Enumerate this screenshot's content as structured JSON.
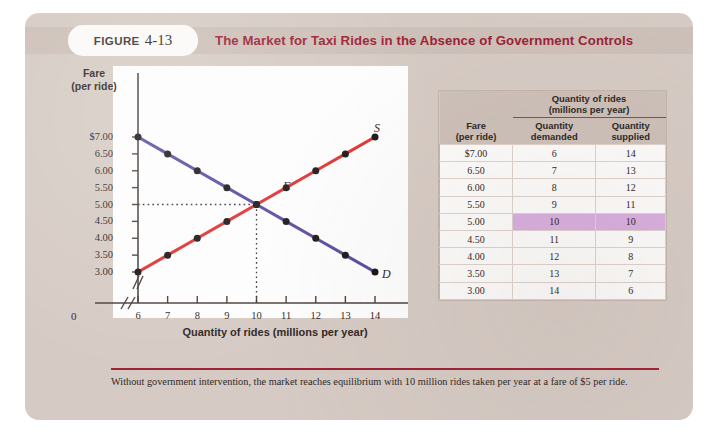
{
  "figure": {
    "label_word": "FIGURE",
    "number": "4-13",
    "title": "The Market for Taxi Rides in the Absence of Government Controls",
    "caption": "Without government intervention, the market reaches equilibrium with 10 million rides taken per year at a fare of $5 per ride.",
    "colors": {
      "panel": "#d6cbc4",
      "header_band": "#cdc0b8",
      "title_red": "#9d2235",
      "supply_red": "#e03030",
      "demand_purple": "#5b4a9e",
      "highlight_purple": "#d9aede",
      "point_black": "#1a1416"
    }
  },
  "chart_data": {
    "type": "line",
    "title": "The Market for Taxi Rides in the Absence of Government Controls",
    "xlabel": "Quantity of rides (millions per year)",
    "ylabel": "Fare (per ride)",
    "ylabel_line1": "Fare",
    "ylabel_line2": "(per ride)",
    "xlim": [
      6,
      14
    ],
    "ylim": [
      3.0,
      7.0
    ],
    "x_ticks": [
      "6",
      "7",
      "8",
      "9",
      "10",
      "11",
      "12",
      "13",
      "14"
    ],
    "x_origin_tick": "0",
    "y_ticks": [
      "$7.00",
      "6.50",
      "6.00",
      "5.50",
      "5.00",
      "4.50",
      "4.00",
      "3.50",
      "3.00"
    ],
    "axis_break_x": true,
    "axis_break_y": true,
    "grid": false,
    "legend": "inline-curve-labels",
    "series": [
      {
        "name": "Supply",
        "label": "S",
        "color": "#e03030",
        "x": [
          6,
          7,
          8,
          9,
          10,
          11,
          12,
          13,
          14
        ],
        "y": [
          3.0,
          3.5,
          4.0,
          4.5,
          5.0,
          5.5,
          6.0,
          6.5,
          7.0
        ]
      },
      {
        "name": "Demand",
        "label": "D",
        "color": "#5b4a9e",
        "x": [
          6,
          7,
          8,
          9,
          10,
          11,
          12,
          13,
          14
        ],
        "y": [
          7.0,
          6.5,
          6.0,
          5.5,
          5.0,
          4.5,
          4.0,
          3.5,
          3.0
        ]
      }
    ],
    "annotations": [
      {
        "label": "E",
        "x": 10,
        "y": 5.0,
        "note": "equilibrium point"
      }
    ],
    "guide_lines": [
      {
        "orientation": "horizontal",
        "value": 5.0,
        "style": "dotted"
      },
      {
        "orientation": "vertical",
        "value": 10,
        "style": "dotted"
      }
    ]
  },
  "table": {
    "group_header_line1": "Quantity of rides",
    "group_header_line2": "(millions per year)",
    "col_fare_line1": "Fare",
    "col_fare_line2": "(per ride)",
    "col_demanded_line1": "Quantity",
    "col_demanded_line2": "demanded",
    "col_supplied_line1": "Quantity",
    "col_supplied_line2": "supplied",
    "rows": [
      {
        "fare": "$7.00",
        "demanded": "6",
        "supplied": "14",
        "highlight": false
      },
      {
        "fare": "6.50",
        "demanded": "7",
        "supplied": "13",
        "highlight": false
      },
      {
        "fare": "6.00",
        "demanded": "8",
        "supplied": "12",
        "highlight": false
      },
      {
        "fare": "5.50",
        "demanded": "9",
        "supplied": "11",
        "highlight": false
      },
      {
        "fare": "5.00",
        "demanded": "10",
        "supplied": "10",
        "highlight": true
      },
      {
        "fare": "4.50",
        "demanded": "11",
        "supplied": "9",
        "highlight": false
      },
      {
        "fare": "4.00",
        "demanded": "12",
        "supplied": "8",
        "highlight": false
      },
      {
        "fare": "3.50",
        "demanded": "13",
        "supplied": "7",
        "highlight": false
      },
      {
        "fare": "3.00",
        "demanded": "14",
        "supplied": "6",
        "highlight": false
      }
    ]
  }
}
